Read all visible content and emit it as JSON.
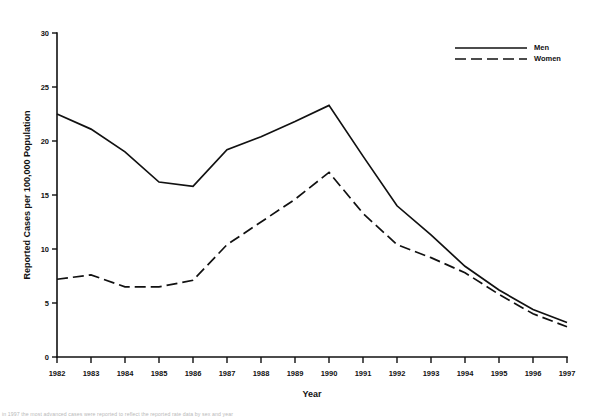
{
  "chart_data": {
    "type": "line",
    "title": "",
    "xlabel": "Year",
    "ylabel": "Reported Cases per 100,000 Population",
    "x": [
      1982,
      1983,
      1984,
      1985,
      1986,
      1987,
      1988,
      1989,
      1990,
      1991,
      1992,
      1993,
      1994,
      1995,
      1996,
      1997
    ],
    "xtick_labels": [
      "1982",
      "1983",
      "1984",
      "1985",
      "1986",
      "1987",
      "1988",
      "1989",
      "1990",
      "1991",
      "1992",
      "1993",
      "1994",
      "1995",
      "1996",
      "1997"
    ],
    "ytick_labels": [
      "0",
      "5",
      "10",
      "15",
      "20",
      "25",
      "30"
    ],
    "yticks": [
      0,
      5,
      10,
      15,
      20,
      25,
      30
    ],
    "ylim": [
      0,
      30
    ],
    "xlim": [
      1982,
      1997
    ],
    "grid": false,
    "legend_position": "top-right",
    "series": [
      {
        "name": "Men",
        "style": "solid",
        "color": "#111111",
        "values": [
          22.5,
          21.1,
          19.0,
          16.2,
          15.8,
          19.2,
          20.4,
          21.8,
          23.3,
          18.6,
          14.0,
          11.3,
          8.4,
          6.2,
          4.4,
          3.2
        ]
      },
      {
        "name": "Women",
        "style": "dashed",
        "color": "#111111",
        "values": [
          7.2,
          7.6,
          6.5,
          6.5,
          7.1,
          10.4,
          12.5,
          14.6,
          17.1,
          13.3,
          10.4,
          9.2,
          7.8,
          5.8,
          4.0,
          2.8
        ]
      }
    ],
    "legend": [
      {
        "label": "Men",
        "style": "solid"
      },
      {
        "label": "Women",
        "style": "dashed"
      }
    ]
  },
  "footnote": {
    "text": "in 1997 the most advanced cases were reported to reflect the reported rate data by sex and year"
  }
}
